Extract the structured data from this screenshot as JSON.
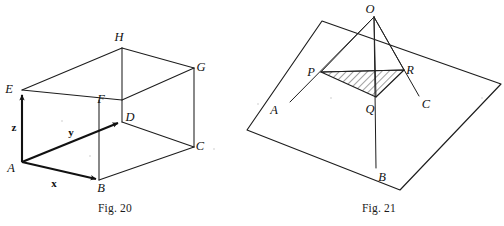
{
  "page": {
    "width": 504,
    "height": 226,
    "background": "#ffffff",
    "ink": "#1d1d1d"
  },
  "figures": [
    {
      "id": "fig-20",
      "caption": "Fig. 20",
      "caption_pos": {
        "x": 115,
        "y": 212
      },
      "description": "Cuboid with vertices A B C D E F G H and vectors x, y, z drawn from A",
      "vertices": [
        {
          "name": "A",
          "label": "A",
          "x": 22,
          "y": 162,
          "label_x": 11,
          "label_y": 172
        },
        {
          "name": "B",
          "label": "B",
          "x": 99,
          "y": 180,
          "label_x": 100,
          "label_y": 192
        },
        {
          "name": "C",
          "label": "C",
          "x": 194,
          "y": 147,
          "label_x": 198,
          "label_y": 148
        },
        {
          "name": "D",
          "label": "D",
          "x": 122,
          "y": 122,
          "label_x": 127,
          "label_y": 120
        },
        {
          "name": "E",
          "label": "E",
          "x": 22,
          "y": 90,
          "label_x": 9,
          "label_y": 93
        },
        {
          "name": "F",
          "label": "F",
          "x": 122,
          "y": 100,
          "label_x": 101,
          "label_y": 102
        },
        {
          "name": "G",
          "label": "G",
          "x": 194,
          "y": 68,
          "label_x": 199,
          "label_y": 69
        },
        {
          "name": "H",
          "label": "H",
          "x": 122,
          "y": 48,
          "label_x": 118,
          "label_y": 40
        }
      ],
      "vectors": [
        {
          "name": "x",
          "label": "x",
          "from": "A",
          "to": "B",
          "label_x": 53,
          "label_y": 186
        },
        {
          "name": "y",
          "label": "y",
          "from": "A",
          "to": "D",
          "label_x": 71,
          "label_y": 135
        },
        {
          "name": "z",
          "label": "z",
          "from": "A",
          "to": "E",
          "label_x": 13,
          "label_y": 130
        }
      ]
    },
    {
      "id": "fig-21",
      "caption": "Fig. 21",
      "caption_pos": {
        "x": 379,
        "y": 212
      },
      "description": "Point O above a plane, with lines OA, OB, OC meeting the plane; triangle PQR shaded with hatching",
      "vertices": [
        {
          "name": "O",
          "label": "O",
          "x": 374,
          "y": 17,
          "label_x": 369,
          "label_y": 12
        },
        {
          "name": "P",
          "label": "P",
          "x": 321,
          "y": 72,
          "label_x": 310,
          "label_y": 74
        },
        {
          "name": "Q",
          "label": "Q",
          "x": 376,
          "y": 97,
          "label_x": 368,
          "label_y": 112
        },
        {
          "name": "R",
          "label": "R",
          "x": 404,
          "y": 70,
          "label_x": 408,
          "label_y": 72
        },
        {
          "name": "A",
          "label": "A",
          "x": 290,
          "y": 102,
          "label_x": 272,
          "label_y": 113
        },
        {
          "name": "B",
          "label": "B",
          "x": 376,
          "y": 168,
          "label_x": 379,
          "label_y": 180
        },
        {
          "name": "C",
          "label": "C",
          "x": 419,
          "y": 96,
          "label_x": 424,
          "label_y": 107
        }
      ],
      "plane_corners": [
        {
          "x": 322,
          "y": 21
        },
        {
          "x": 501,
          "y": 84
        },
        {
          "x": 400,
          "y": 190
        },
        {
          "x": 247,
          "y": 130
        }
      ],
      "shaded_triangle": [
        "P",
        "Q",
        "R"
      ],
      "hatch": {
        "angle_deg": 45,
        "spacing": 5,
        "color": "#1d1d1d"
      }
    }
  ]
}
